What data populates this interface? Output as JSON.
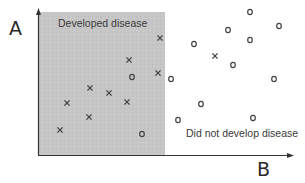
{
  "axes": {
    "y_label": "A",
    "x_label": "B"
  },
  "regions": {
    "developed": {
      "label": "Developed disease",
      "fill": "#c4c4c4"
    },
    "not_developed": {
      "label": "Did not develop disease"
    }
  },
  "colors": {
    "axis": "#333333",
    "marker": "#444444",
    "text": "#333333"
  },
  "points": [
    {
      "marker": "x",
      "x": 160,
      "y": 38
    },
    {
      "marker": "x",
      "x": 129,
      "y": 60
    },
    {
      "marker": "x",
      "x": 158,
      "y": 73
    },
    {
      "marker": "o",
      "x": 132,
      "y": 77
    },
    {
      "marker": "x",
      "x": 90,
      "y": 88
    },
    {
      "marker": "x",
      "x": 109,
      "y": 93
    },
    {
      "marker": "x",
      "x": 127,
      "y": 102
    },
    {
      "marker": "x",
      "x": 67,
      "y": 103
    },
    {
      "marker": "x",
      "x": 89,
      "y": 117
    },
    {
      "marker": "x",
      "x": 60,
      "y": 130
    },
    {
      "marker": "o",
      "x": 142,
      "y": 134
    },
    {
      "marker": "o",
      "x": 250,
      "y": 12
    },
    {
      "marker": "o",
      "x": 279,
      "y": 26
    },
    {
      "marker": "o",
      "x": 228,
      "y": 30
    },
    {
      "marker": "o",
      "x": 250,
      "y": 40
    },
    {
      "marker": "o",
      "x": 194,
      "y": 44
    },
    {
      "marker": "x",
      "x": 215,
      "y": 56
    },
    {
      "marker": "o",
      "x": 233,
      "y": 65
    },
    {
      "marker": "o",
      "x": 171,
      "y": 79
    },
    {
      "marker": "o",
      "x": 274,
      "y": 79
    },
    {
      "marker": "o",
      "x": 201,
      "y": 104
    },
    {
      "marker": "o",
      "x": 253,
      "y": 118
    },
    {
      "marker": "o",
      "x": 178,
      "y": 120
    }
  ]
}
